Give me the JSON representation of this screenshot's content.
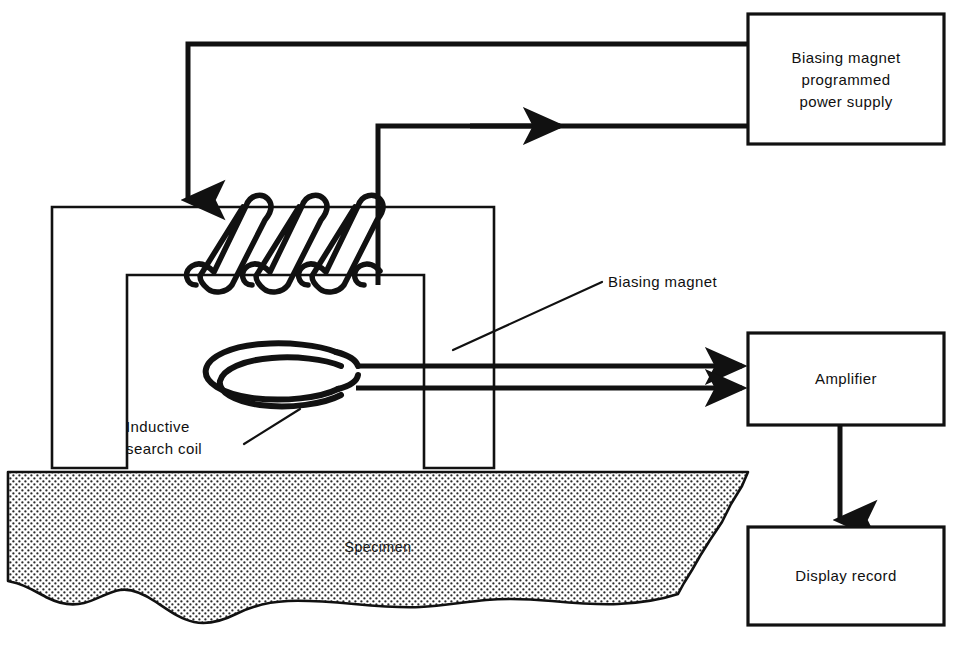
{
  "diagram": {
    "stroke_color": "#111111",
    "background_color": "#ffffff"
  },
  "blocks": [
    {
      "id": "power-supply",
      "lines": [
        "Biasing magnet",
        "programmed",
        "power supply"
      ]
    },
    {
      "id": "amplifier",
      "lines": [
        "Amplifier"
      ]
    },
    {
      "id": "display-record",
      "lines": [
        "Display record"
      ]
    }
  ],
  "callouts": [
    {
      "id": "biasing-magnet",
      "lines": [
        "Biasing magnet"
      ]
    },
    {
      "id": "inductive-search-coil",
      "lines": [
        "Inductive",
        "search coil"
      ]
    }
  ],
  "specimen": {
    "label": "Specimen",
    "fill_pattern": "stipple-dots"
  },
  "components": {
    "magnet_yoke": "biasing-magnet-yoke",
    "excitation_coil_turns": 3,
    "search_coil_turns": 2,
    "amplifier_leads": 2
  }
}
